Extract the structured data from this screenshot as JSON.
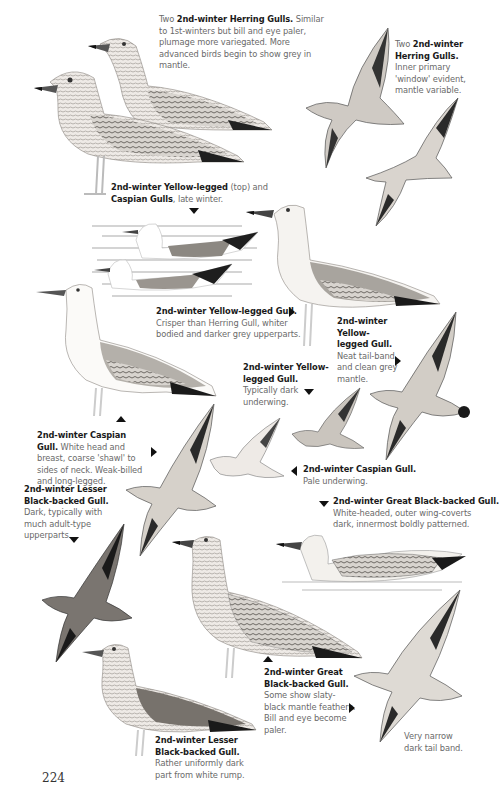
{
  "page": {
    "number": "224"
  },
  "captions": [
    {
      "id": "herring-pair",
      "prefix": "Two ",
      "title": "2nd-winter Herring Gulls.",
      "mid": "",
      "title2": "",
      "body": " Similar to 1st-winters but bill and eye paler, plumage more variegated. More advanced birds begin to show grey in mantle."
    },
    {
      "id": "herring-flight",
      "prefix": "Two ",
      "title": "2nd-winter Herring Gulls.",
      "mid": "",
      "title2": "",
      "body": " Inner primary 'window' evident, mantle variable."
    },
    {
      "id": "yl-caspian-swim",
      "prefix": "",
      "title": "2nd-winter Yellow-legged",
      "mid": " (top) and ",
      "title2": "Caspian Gulls",
      "body": ", late winter."
    },
    {
      "id": "yl-standing",
      "prefix": "",
      "title": "2nd-winter Yellow-legged Gull.",
      "mid": "",
      "title2": "",
      "body": " Crisper than Herring Gull, whiter bodied and darker grey upperparts."
    },
    {
      "id": "yl-flight-upper",
      "prefix": "",
      "title": "2nd-winter Yellow-legged Gull.",
      "mid": "",
      "title2": "",
      "body": " Neat tail-band and clean grey mantle."
    },
    {
      "id": "yl-flight-under",
      "prefix": "",
      "title": "2nd-winter Yellow-legged Gull.",
      "mid": "",
      "title2": "",
      "body": " Typically dark underwing."
    },
    {
      "id": "caspian-standing",
      "prefix": "",
      "title": "2nd-winter Caspian Gull.",
      "mid": "",
      "title2": "",
      "body": " White head and breast, coarse 'shawl' to sides of neck. Weak-billed and long-legged."
    },
    {
      "id": "lbb-flight",
      "prefix": "",
      "title": "2nd-winter Lesser Black-backed Gull.",
      "mid": "",
      "title2": "",
      "body": " Dark, typically with much adult-type upperparts."
    },
    {
      "id": "caspian-flight",
      "prefix": "",
      "title": "2nd-winter Caspian Gull.",
      "mid": "",
      "title2": "",
      "body": " Pale underwing."
    },
    {
      "id": "gbb-swim",
      "prefix": "",
      "title": "2nd-winter Great Black-backed Gull.",
      "mid": "",
      "title2": "",
      "body": " White-headed, outer wing-coverts dark, innermost boldly patterned."
    },
    {
      "id": "gbb-standing",
      "prefix": "",
      "title": "2nd-winter Great Black-backed Gull.",
      "mid": "",
      "title2": "",
      "body": " Some show slaty-black mantle feathers. Bill and eye become paler."
    },
    {
      "id": "lbb-standing",
      "prefix": "",
      "title": "2nd-winter Lesser Black-backed Gull.",
      "mid": "",
      "title2": "",
      "body": " Rather uniformly dark part from white rump."
    },
    {
      "id": "gbb-tail",
      "prefix": "",
      "title": "",
      "mid": "",
      "title2": "",
      "body": "Very narrow dark tail band."
    }
  ],
  "colors": {
    "ink": "#1a1a1a",
    "caption_grey": "#6a6a6a",
    "plumage_mid": "#9a9a9a",
    "plumage_dark": "#333333",
    "paper": "#ffffff"
  }
}
